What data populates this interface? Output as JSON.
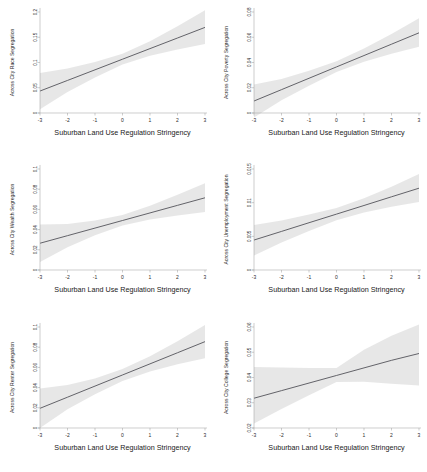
{
  "figure": {
    "type": "multi-panel-regression-figure",
    "rows": 3,
    "cols": 2,
    "shared_xlabel": "Suburban Land Use Regulation Stringency",
    "line_color": "#4a4a52",
    "band_color": "#d9d9d9",
    "background": "#ffffff"
  },
  "chart_data": [
    {
      "type": "line",
      "panel": 1,
      "title": "",
      "xlabel": "Suburban Land Use Regulation Stringency",
      "ylabel": "Across City Race Segregation",
      "xlim": [
        -3,
        3
      ],
      "ylim": [
        0,
        0.2
      ],
      "xticks": [
        -3,
        -2,
        -1,
        0,
        1,
        2,
        3
      ],
      "xticklabels": [
        "-3",
        "-2",
        "-1",
        "0",
        "1",
        "2",
        "3"
      ],
      "yticks": [
        0,
        0.05,
        0.1,
        0.15,
        0.2
      ],
      "yticklabels": [
        "0",
        "0.05",
        "0.1",
        "0.15",
        "0.2"
      ],
      "grid": false,
      "legend": "none",
      "x": [
        -3,
        -2,
        -1,
        0,
        1,
        2,
        3
      ],
      "fit": [
        0.0435,
        0.0645,
        0.0855,
        0.1065,
        0.1275,
        0.1485,
        0.1695
      ],
      "ci_lower": [
        0.0075,
        0.0415,
        0.0705,
        0.096,
        0.1135,
        0.1255,
        0.1365
      ],
      "ci_upper": [
        0.079,
        0.088,
        0.101,
        0.1175,
        0.142,
        0.172,
        0.2035
      ]
    },
    {
      "type": "line",
      "panel": 2,
      "title": "",
      "xlabel": "Suburban Land Use Regulation Stringency",
      "ylabel": "Across City Poverty Segregation",
      "xlim": [
        -3,
        3
      ],
      "ylim": [
        0,
        0.08
      ],
      "xticks": [
        -3,
        -2,
        -1,
        0,
        1,
        2,
        3
      ],
      "xticklabels": [
        "-3",
        "-2",
        "-1",
        "0",
        "1",
        "2",
        "3"
      ],
      "yticks": [
        0,
        0.02,
        0.04,
        0.06,
        0.08
      ],
      "yticklabels": [
        "0",
        "0.02",
        "0.04",
        "0.06",
        "0.08"
      ],
      "grid": false,
      "legend": "none",
      "x": [
        -3,
        -2,
        -1,
        0,
        1,
        2,
        3
      ],
      "fit": [
        0.0095,
        0.0185,
        0.0275,
        0.0365,
        0.0455,
        0.0545,
        0.0635
      ],
      "ci_lower": [
        -0.0035,
        0.01,
        0.0215,
        0.0325,
        0.0405,
        0.047,
        0.0525
      ],
      "ci_upper": [
        0.0225,
        0.027,
        0.0335,
        0.041,
        0.051,
        0.0625,
        0.075
      ]
    },
    {
      "type": "line",
      "panel": 3,
      "title": "",
      "xlabel": "Suburban Land Use Regulation Stringency",
      "ylabel": "Across City Wealth Segregation",
      "xlim": [
        -3,
        3
      ],
      "ylim": [
        0,
        0.1
      ],
      "xticks": [
        -3,
        -2,
        -1,
        0,
        1,
        2,
        3
      ],
      "xticklabels": [
        "-3",
        "-2",
        "-1",
        "0",
        "1",
        "2",
        "3"
      ],
      "yticks": [
        0,
        0.02,
        0.04,
        0.06,
        0.08,
        0.1
      ],
      "yticklabels": [
        "0",
        "0.02",
        "0.04",
        "0.06",
        "0.08",
        "0.1"
      ],
      "grid": false,
      "legend": "none",
      "x": [
        -3,
        -2,
        -1,
        0,
        1,
        2,
        3
      ],
      "fit": [
        0.0265,
        0.034,
        0.0415,
        0.049,
        0.0565,
        0.064,
        0.0715
      ],
      "ci_lower": [
        0.008,
        0.0225,
        0.0345,
        0.044,
        0.05,
        0.054,
        0.0575
      ],
      "ci_upper": [
        0.045,
        0.0455,
        0.049,
        0.0545,
        0.0635,
        0.0745,
        0.086
      ]
    },
    {
      "type": "line",
      "panel": 4,
      "title": "",
      "xlabel": "Suburban Land Use Regulation Stringency",
      "ylabel": "Across City Unemployment Segregation",
      "xlim": [
        -3,
        3
      ],
      "ylim": [
        0,
        0.015
      ],
      "xticks": [
        -3,
        -2,
        -1,
        0,
        1,
        2,
        3
      ],
      "xticklabels": [
        "-3",
        "-2",
        "-1",
        "0",
        "1",
        "2",
        "3"
      ],
      "yticks": [
        0,
        0.005,
        0.01,
        0.015
      ],
      "yticklabels": [
        "0",
        "0.005",
        "0.01",
        "0.015"
      ],
      "grid": false,
      "legend": "none",
      "x": [
        -3,
        -2,
        -1,
        0,
        1,
        2,
        3
      ],
      "fit": [
        0.00445,
        0.00573,
        0.00702,
        0.0083,
        0.00958,
        0.01087,
        0.01215
      ],
      "ci_lower": [
        0.00215,
        0.0041,
        0.0058,
        0.0074,
        0.00855,
        0.0094,
        0.0101
      ],
      "ci_upper": [
        0.0067,
        0.00735,
        0.00825,
        0.0092,
        0.01065,
        0.01235,
        0.01425
      ]
    },
    {
      "type": "line",
      "panel": 5,
      "title": "",
      "xlabel": "Suburban Land Use Regulation Stringency",
      "ylabel": "Across City Renter Segregation",
      "xlim": [
        -3,
        3
      ],
      "ylim": [
        0,
        0.1
      ],
      "xticks": [
        -3,
        -2,
        -1,
        0,
        1,
        2,
        3
      ],
      "xticklabels": [
        "-3",
        "-2",
        "-1",
        "0",
        "1",
        "2",
        "3"
      ],
      "yticks": [
        0,
        0.02,
        0.04,
        0.06,
        0.08,
        0.1
      ],
      "yticklabels": [
        "0",
        "0.02",
        "0.04",
        "0.06",
        "0.08",
        "0.1"
      ],
      "grid": false,
      "legend": "none",
      "x": [
        -3,
        -2,
        -1,
        0,
        1,
        2,
        3
      ],
      "fit": [
        0.0195,
        0.0305,
        0.0415,
        0.0525,
        0.0635,
        0.0745,
        0.0855
      ],
      "ci_lower": [
        0.0,
        0.0185,
        0.0335,
        0.0465,
        0.056,
        0.063,
        0.069
      ],
      "ci_upper": [
        0.039,
        0.0425,
        0.049,
        0.0585,
        0.071,
        0.086,
        0.102
      ]
    },
    {
      "type": "line",
      "panel": 6,
      "title": "",
      "xlabel": "Suburban Land Use Regulation Stringency",
      "ylabel": "Across City College Segregation",
      "xlim": [
        -3,
        3
      ],
      "ylim": [
        0.02,
        0.06
      ],
      "xticks": [
        -3,
        -2,
        -1,
        0,
        1,
        2,
        3
      ],
      "xticklabels": [
        "-3",
        "-2",
        "-1",
        "0",
        "1",
        "2",
        "3"
      ],
      "yticks": [
        0.02,
        0.03,
        0.04,
        0.05,
        0.06
      ],
      "yticklabels": [
        "0.02",
        "0.03",
        "0.04",
        "0.05",
        "0.06"
      ],
      "grid": false,
      "legend": "none",
      "x": [
        -3,
        -2,
        -1,
        0,
        1,
        2,
        3
      ],
      "fit": [
        0.0318,
        0.0348,
        0.0378,
        0.0408,
        0.0438,
        0.0468,
        0.0495
      ],
      "ci_lower": [
        0.0218,
        0.0275,
        0.033,
        0.0382,
        0.0383,
        0.0375,
        0.0368
      ],
      "ci_upper": [
        0.0442,
        0.044,
        0.0438,
        0.0438,
        0.051,
        0.0565,
        0.061
      ]
    }
  ]
}
